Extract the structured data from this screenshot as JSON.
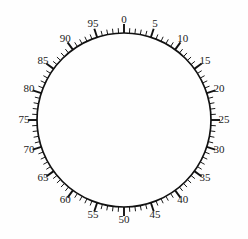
{
  "figure": {
    "name": "circular-dial-scale",
    "background_color": "#fefefe",
    "line_color": "#111111",
    "label_color": "#222222"
  },
  "chart_data": {
    "type": "scatter",
    "title": "",
    "subtitle": "",
    "xlabel": "",
    "ylabel": "",
    "grid": false,
    "legend": null,
    "geometry": {
      "center_x": 124,
      "center_y": 120,
      "radius": 87,
      "label_radius": 100,
      "major_tick_length": 9,
      "minor_tick_length": 5,
      "zero_angle_deg": -90,
      "direction": "clockwise"
    },
    "scale": {
      "units_full_turn": 100,
      "minor_tick_step": 1,
      "major_tick_step": 5,
      "label_step": 5,
      "minor_tick_count": 100,
      "major_tick_count": 20
    },
    "categories": [
      "0",
      "5",
      "10",
      "15",
      "20",
      "25",
      "30",
      "35",
      "40",
      "45",
      "50",
      "55",
      "60",
      "65",
      "70",
      "75",
      "80",
      "85",
      "90",
      "95"
    ],
    "values": [
      0,
      5,
      10,
      15,
      20,
      25,
      30,
      35,
      40,
      45,
      50,
      55,
      60,
      65,
      70,
      75,
      80,
      85,
      90,
      95
    ],
    "tick_labels": [
      {
        "value": 0,
        "text": "0",
        "angle_deg": -90
      },
      {
        "value": 5,
        "text": "5",
        "angle_deg": -72
      },
      {
        "value": 10,
        "text": "10",
        "angle_deg": -54
      },
      {
        "value": 15,
        "text": "15",
        "angle_deg": -36
      },
      {
        "value": 20,
        "text": "20",
        "angle_deg": -18
      },
      {
        "value": 25,
        "text": "25",
        "angle_deg": 0
      },
      {
        "value": 30,
        "text": "30",
        "angle_deg": 18
      },
      {
        "value": 35,
        "text": "35",
        "angle_deg": 36
      },
      {
        "value": 40,
        "text": "40",
        "angle_deg": 54
      },
      {
        "value": 45,
        "text": "45",
        "angle_deg": 72
      },
      {
        "value": 50,
        "text": "50",
        "angle_deg": 90
      },
      {
        "value": 55,
        "text": "55",
        "angle_deg": 108
      },
      {
        "value": 60,
        "text": "60",
        "angle_deg": 126
      },
      {
        "value": 65,
        "text": "65",
        "angle_deg": 144
      },
      {
        "value": 70,
        "text": "70",
        "angle_deg": 162
      },
      {
        "value": 75,
        "text": "75",
        "angle_deg": 180
      },
      {
        "value": 80,
        "text": "80",
        "angle_deg": 198
      },
      {
        "value": 85,
        "text": "85",
        "angle_deg": 216
      },
      {
        "value": 90,
        "text": "90",
        "angle_deg": 234
      },
      {
        "value": 95,
        "text": "95",
        "angle_deg": 252
      }
    ]
  }
}
